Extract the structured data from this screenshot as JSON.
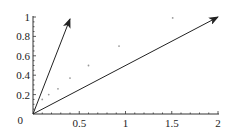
{
  "chart_data": {
    "type": "scatter",
    "title": "",
    "xlabel": "",
    "ylabel": "",
    "xlim": [
      0,
      2
    ],
    "ylim": [
      0,
      1
    ],
    "xticks": [
      "0.5",
      "1",
      "1.5",
      "2"
    ],
    "yticks": [
      "0.2",
      "0.4",
      "0.6",
      "0.8",
      "1"
    ],
    "origin_label": "0",
    "grid": false,
    "series": [
      {
        "name": "points",
        "kind": "scatter",
        "x": [
          0.1,
          0.17,
          0.27,
          0.4,
          0.6,
          0.93,
          1.51
        ],
        "y": [
          0.15,
          0.2,
          0.26,
          0.37,
          0.5,
          0.7,
          0.99
        ]
      },
      {
        "name": "vector-1",
        "kind": "arrow",
        "x": [
          0,
          0.4
        ],
        "y": [
          0,
          0.98
        ]
      },
      {
        "name": "vector-2",
        "kind": "arrow",
        "x": [
          0,
          2.0
        ],
        "y": [
          0,
          1.0
        ]
      }
    ],
    "colors": {
      "axis": "#333333",
      "arrow": "#222222",
      "point": "#999999"
    }
  }
}
